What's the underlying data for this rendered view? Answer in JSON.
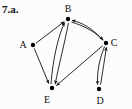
{
  "figure": {
    "problem_label": "7.a.",
    "width": 132,
    "height": 109,
    "background_color": "#fcfcfc",
    "ink_color": "#141414"
  },
  "graph": {
    "type": "directed-graph",
    "node_labels": {
      "A": "A",
      "B": "B",
      "C": "C",
      "D": "D",
      "E": "E"
    },
    "nodes": [
      {
        "id": "A",
        "label": "A",
        "x": 33,
        "y": 45,
        "label_x": 23,
        "label_y": 48
      },
      {
        "id": "B",
        "label": "B",
        "x": 68,
        "y": 19,
        "label_x": 65,
        "label_y": 12
      },
      {
        "id": "C",
        "label": "C",
        "x": 106,
        "y": 43,
        "label_x": 111,
        "label_y": 46
      },
      {
        "id": "D",
        "label": "D",
        "x": 99,
        "y": 89,
        "label_x": 96,
        "label_y": 104
      },
      {
        "id": "E",
        "label": "E",
        "x": 52,
        "y": 88,
        "label_x": 43,
        "label_y": 103
      }
    ],
    "edges": [
      {
        "from": "A",
        "to": "B",
        "arrow": "to",
        "style": "straight"
      },
      {
        "from": "A",
        "to": "E",
        "arrow": "to",
        "style": "straight"
      },
      {
        "from": "E",
        "to": "B",
        "arrow": "to",
        "style": "curved"
      },
      {
        "from": "B",
        "to": "E",
        "arrow": "to",
        "style": "curved"
      },
      {
        "from": "B",
        "to": "C",
        "arrow": "to",
        "style": "curved"
      },
      {
        "from": "C",
        "to": "B",
        "arrow": "to",
        "style": "curved"
      },
      {
        "from": "C",
        "to": "E",
        "arrow": "to",
        "style": "straight"
      },
      {
        "from": "C",
        "to": "D",
        "arrow": "to",
        "style": "curved"
      },
      {
        "from": "D",
        "to": "C",
        "arrow": "to",
        "style": "curved"
      }
    ]
  }
}
